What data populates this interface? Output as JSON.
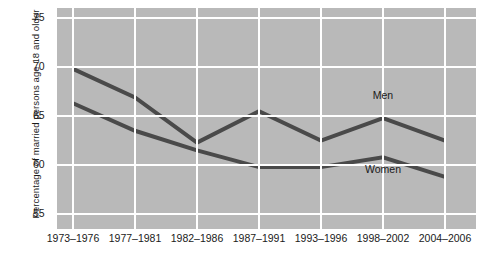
{
  "chart_data": {
    "type": "line",
    "title": "",
    "xlabel": "",
    "ylabel": "Percentage of married persons age 18 and older",
    "categories": [
      "1973–1976",
      "1977–1981",
      "1982–1986",
      "1987–1991",
      "1993–1996",
      "1998–2002",
      "2004–2006"
    ],
    "yticks": [
      55,
      60,
      65,
      70,
      75
    ],
    "ylim": [
      53.5,
      76.0
    ],
    "grid": true,
    "legend_position": "inline-labels",
    "series": [
      {
        "name": "Men",
        "color": "#4a4a4a",
        "values": [
          69.8,
          66.9,
          62.3,
          65.5,
          62.5,
          64.8,
          62.5
        ]
      },
      {
        "name": "Women",
        "color": "#4a4a4a",
        "values": [
          66.3,
          63.5,
          61.5,
          59.8,
          59.8,
          60.8,
          58.8
        ]
      }
    ],
    "annotations": [
      {
        "text": "Men",
        "category_index": 5,
        "value": 67.0
      },
      {
        "text": "Women",
        "category_index": 5,
        "value": 59.5
      }
    ]
  },
  "colors": {
    "plot_background": "#b9b9b9",
    "gridline": "#ffffff",
    "line": "#4a4a4a",
    "text": "#1a1a1a",
    "page_background": "#ffffff"
  }
}
